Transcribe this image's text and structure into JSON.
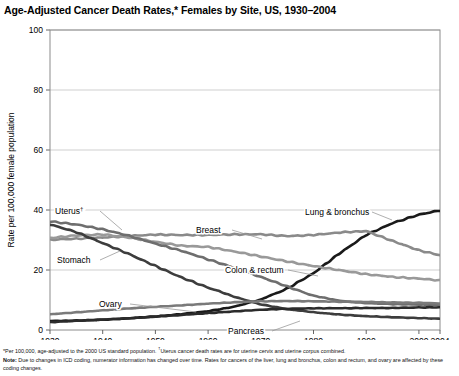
{
  "title": "Age-Adjusted Cancer Death Rates,* Females by Site, US, 1930–2004",
  "axis": {
    "ylabel": "Rate per 100,000 female population",
    "yticks": [
      "0",
      "20",
      "40",
      "60",
      "80",
      "100"
    ],
    "xticks": [
      "1930",
      "1940",
      "1950",
      "1960",
      "1970",
      "1980",
      "1990",
      "2000",
      "2004"
    ]
  },
  "footnotes": {
    "line1_a": "*Per 100,000, age-adjusted to the 2000 US standard population. ",
    "line1_sup": "†",
    "line1_b": "Uterus cancer death rates are for uterine cervix and uterine corpus combined.",
    "note_label": "Note:",
    "note_text": " Due to changes in ICD coding, numerator information has changed over time. Rates for cancers of the liver, lung and bronchus, colon and rectum, and ovary are affected by these coding changes."
  },
  "colors": {
    "lung": "#1a1a1a",
    "stomach": "#3d3d3d",
    "uterus": "#6e6e6e",
    "breast": "#8a8a8a",
    "colon": "#999999",
    "ovary": "#7a7a7a",
    "pancreas": "#2b2b2b",
    "grid": "#c9c9c9",
    "frame": "#8c8c8c",
    "leader": "#9a9a9a"
  },
  "chart_data": {
    "type": "line",
    "title": "Age-Adjusted Cancer Death Rates,* Females by Site, US, 1930–2004",
    "xlabel": "",
    "ylabel": "Rate per 100,000 female population",
    "xlim": [
      1930,
      2004
    ],
    "ylim": [
      0,
      100
    ],
    "grid": true,
    "legend": "inline-labels",
    "x": [
      1930,
      1935,
      1940,
      1945,
      1950,
      1955,
      1960,
      1965,
      1970,
      1975,
      1980,
      1985,
      1990,
      1995,
      2000,
      2004
    ],
    "series": [
      {
        "name": "Lung & bronchus",
        "label": "Lung & bronchus",
        "color": "#1a1a1a",
        "values": [
          3.0,
          3.2,
          3.5,
          3.9,
          4.5,
          5.2,
          6.2,
          7.8,
          10.2,
          14.0,
          19.0,
          25.5,
          31.5,
          35.5,
          38.5,
          40.0
        ]
      },
      {
        "name": "Breast",
        "label": "Breast",
        "color": "#8a8a8a",
        "values": [
          30.0,
          30.5,
          31.0,
          31.5,
          31.8,
          31.5,
          31.5,
          31.8,
          32.0,
          31.5,
          31.8,
          32.5,
          32.8,
          29.5,
          26.5,
          25.0
        ]
      },
      {
        "name": "Colon & rectum",
        "label": "Colon & rectum",
        "color": "#999999",
        "values": [
          30.5,
          31.5,
          32.0,
          31.0,
          29.5,
          28.0,
          27.5,
          26.0,
          24.5,
          23.0,
          21.5,
          20.0,
          18.5,
          17.5,
          17.0,
          16.5
        ]
      },
      {
        "name": "Stomach",
        "label": "Stomach",
        "color": "#3d3d3d",
        "values": [
          35.0,
          32.5,
          29.0,
          25.5,
          21.5,
          17.5,
          14.0,
          11.0,
          8.5,
          7.0,
          6.0,
          5.2,
          4.6,
          4.2,
          3.9,
          3.7
        ]
      },
      {
        "name": "Uterus",
        "label": "Uterus",
        "label_sup": "†",
        "color": "#6e6e6e",
        "values": [
          36.0,
          35.0,
          33.5,
          31.5,
          29.0,
          26.5,
          23.5,
          20.5,
          17.5,
          14.5,
          11.5,
          9.8,
          9.0,
          8.6,
          8.4,
          8.2
        ]
      },
      {
        "name": "Ovary",
        "label": "Ovary",
        "color": "#7a7a7a",
        "values": [
          5.2,
          5.8,
          6.5,
          7.2,
          7.8,
          8.3,
          8.8,
          9.2,
          9.5,
          9.6,
          9.6,
          9.5,
          9.4,
          9.2,
          9.0,
          8.8
        ]
      },
      {
        "name": "Pancreas",
        "label": "Pancreas",
        "color": "#2b2b2b",
        "values": [
          2.6,
          3.0,
          3.4,
          3.9,
          4.5,
          5.1,
          5.7,
          6.2,
          6.7,
          7.0,
          7.2,
          7.3,
          7.4,
          7.4,
          7.5,
          7.5
        ]
      }
    ]
  }
}
